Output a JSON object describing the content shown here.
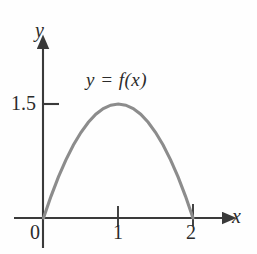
{
  "figure": {
    "background_color": "#fefefe",
    "axis_color": "#3a3a3a",
    "curve_color": "#8c8c8c",
    "text_color": "#2b2b2b"
  },
  "labels": {
    "y_axis": "y",
    "x_axis": "x",
    "curve": "y = f(x)",
    "origin": "0",
    "x_tick_1": "1",
    "x_tick_2": "2",
    "y_tick_1_5": "1.5"
  },
  "chart_data": {
    "type": "line",
    "title": "",
    "xlabel": "x",
    "ylabel": "y",
    "series": [
      {
        "name": "y = f(x)",
        "color": "#8c8c8c",
        "x": [
          0,
          0.1,
          0.2,
          0.3,
          0.4,
          0.5,
          0.6,
          0.7,
          0.8,
          0.9,
          1.0,
          1.1,
          1.2,
          1.3,
          1.4,
          1.5,
          1.6,
          1.7,
          1.8,
          1.9,
          2.0
        ],
        "y": [
          0,
          0.285,
          0.54,
          0.765,
          0.96,
          1.125,
          1.26,
          1.365,
          1.44,
          1.485,
          1.5,
          1.485,
          1.44,
          1.365,
          1.26,
          1.125,
          0.96,
          0.765,
          0.54,
          0.285,
          0
        ]
      }
    ],
    "xlim": [
      0,
      2.25
    ],
    "ylim": [
      0,
      2.1
    ],
    "xticks": [
      0,
      1,
      2
    ],
    "xtick_labels": [
      "0",
      "1",
      "2"
    ],
    "yticks": [
      1.5
    ],
    "ytick_labels": [
      "1.5"
    ],
    "grid": false,
    "legend": "none",
    "annotations": [
      {
        "text": "y = f(x)",
        "x": 0.95,
        "y": 1.85,
        "name": "curve-equation-annotation"
      }
    ]
  }
}
